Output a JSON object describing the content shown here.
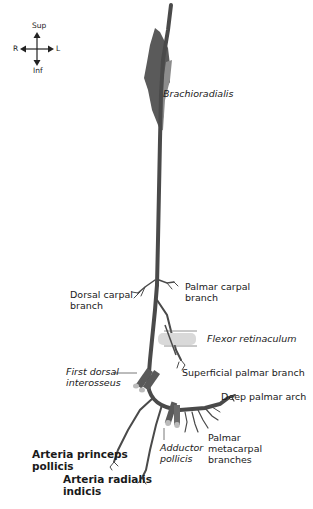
{
  "orientation": {
    "superior": "Sup",
    "inferior": "Inf",
    "right": "R",
    "left": "L"
  },
  "labels": {
    "brachioradialis": "Brachioradialis",
    "palmar_carpal_1": "Palmar carpal",
    "palmar_carpal_2": "branch",
    "dorsal_carpal_1": "Dorsal carpal",
    "dorsal_carpal_2": "branch",
    "flexor_retinaculum": "Flexor retinaculum",
    "first_dorsal_1": "First dorsal",
    "first_dorsal_2": "interosseus",
    "superficial_palmar": "Superficial palmar branch",
    "deep_palmar_arch": "Deep palmar arch",
    "adductor_1": "Adductor",
    "adductor_2": "pollicis",
    "palmar_metacarpal_1": "Palmar",
    "palmar_metacarpal_2": "metacarpal",
    "palmar_metacarpal_3": "branches",
    "princeps_1": "Arteria princeps",
    "princeps_2": "pollicis",
    "radialis_indicis_1": "Arteria radialis",
    "radialis_indicis_2": "indicis"
  },
  "colors": {
    "artery": "#4a4a4a",
    "muscle_dark": "#5a5a5a",
    "muscle_light": "#8c8c8c",
    "retinaculum": "#d9d9d9",
    "text": "#1a1a1a"
  }
}
